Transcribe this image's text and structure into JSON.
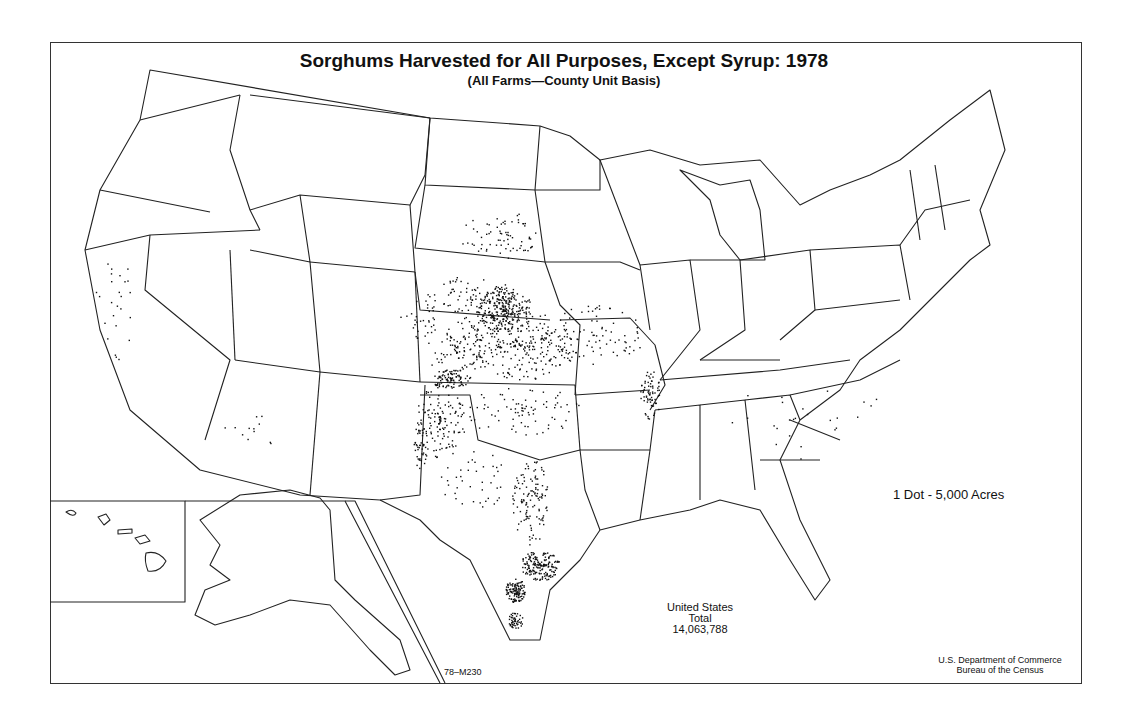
{
  "map": {
    "title": "Sorghums Harvested for All Purposes, Except Syrup:  1978",
    "subtitle": "(All Farms—County Unit Basis)",
    "legend": "1 Dot - 5,000 Acres",
    "total": {
      "line1": "United States",
      "line2": "Total",
      "line3": "14,063,788"
    },
    "map_code": "78–M230",
    "credit": {
      "line1": "U.S. Department of Commerce",
      "line2": "Bureau of the Census"
    },
    "insets": [
      "Hawaii",
      "Alaska"
    ],
    "dot_value_acres": 5000,
    "clusters": [
      {
        "region": "SE Nebraska",
        "cx": 505,
        "cy": 310,
        "rx": 28,
        "ry": 22,
        "n": 260
      },
      {
        "region": "Nebraska central",
        "cx": 470,
        "cy": 300,
        "rx": 45,
        "ry": 25,
        "n": 90
      },
      {
        "region": "Kansas central",
        "cx": 520,
        "cy": 345,
        "rx": 60,
        "ry": 35,
        "n": 260
      },
      {
        "region": "Kansas west",
        "cx": 455,
        "cy": 350,
        "rx": 30,
        "ry": 30,
        "n": 80
      },
      {
        "region": "SW Kansas/OK panhandle",
        "cx": 450,
        "cy": 378,
        "rx": 22,
        "ry": 10,
        "n": 90
      },
      {
        "region": "Texas panhandle",
        "cx": 440,
        "cy": 420,
        "rx": 25,
        "ry": 38,
        "n": 130
      },
      {
        "region": "E New Mexico",
        "cx": 420,
        "cy": 445,
        "rx": 8,
        "ry": 25,
        "n": 45
      },
      {
        "region": "South Dakota",
        "cx": 500,
        "cy": 235,
        "rx": 40,
        "ry": 25,
        "n": 70
      },
      {
        "region": "Missouri",
        "cx": 595,
        "cy": 335,
        "rx": 50,
        "ry": 30,
        "n": 80
      },
      {
        "region": "Oklahoma",
        "cx": 520,
        "cy": 410,
        "rx": 60,
        "ry": 25,
        "n": 80
      },
      {
        "region": "Central Texas",
        "cx": 530,
        "cy": 500,
        "rx": 18,
        "ry": 45,
        "n": 120
      },
      {
        "region": "Texas coast",
        "cx": 540,
        "cy": 565,
        "rx": 20,
        "ry": 15,
        "n": 170
      },
      {
        "region": "Corpus Christi",
        "cx": 515,
        "cy": 590,
        "rx": 10,
        "ry": 12,
        "n": 120
      },
      {
        "region": "Lower Rio Grande",
        "cx": 515,
        "cy": 620,
        "rx": 8,
        "ry": 8,
        "n": 50
      },
      {
        "region": "Arkansas delta",
        "cx": 650,
        "cy": 395,
        "rx": 10,
        "ry": 25,
        "n": 70
      },
      {
        "region": "Colorado east",
        "cx": 420,
        "cy": 320,
        "rx": 20,
        "ry": 20,
        "n": 30
      },
      {
        "region": "California",
        "cx": 115,
        "cy": 300,
        "rx": 20,
        "ry": 60,
        "n": 25
      },
      {
        "region": "Arizona",
        "cx": 250,
        "cy": 430,
        "rx": 30,
        "ry": 20,
        "n": 12
      },
      {
        "region": "Louisiana/Georgia/Carolina",
        "cx": 800,
        "cy": 420,
        "rx": 90,
        "ry": 40,
        "n": 25
      },
      {
        "region": "Texas west",
        "cx": 475,
        "cy": 480,
        "rx": 35,
        "ry": 30,
        "n": 40
      }
    ]
  }
}
